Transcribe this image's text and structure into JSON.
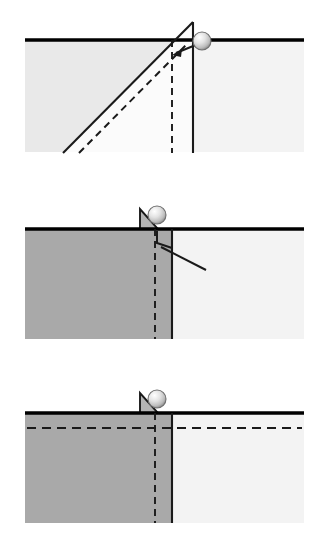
{
  "figure": {
    "type": "diagram",
    "background_color": "#ffffff",
    "width": 323,
    "height": 554,
    "panel_count": 3
  },
  "colors": {
    "stroke": "#1a1a1a",
    "surface_line": "#000000",
    "fill_light": "#e9e9e9",
    "fill_lighter": "#f3f3f3",
    "fill_dark": "#a9a9a9",
    "fill_medium": "#b4b4b4",
    "ball_light": "#f7f7f7",
    "ball_mid": "#cfcfcf",
    "ball_dark": "#8e8e8e",
    "background": "#ffffff"
  },
  "geometry": {
    "block_left": 25,
    "block_right": 304,
    "surface_thickness": 3.5,
    "panel_height": 185
  },
  "panels": [
    {
      "id": "panel-1",
      "label": "stage-1-initial-shear-ramp",
      "index": 1,
      "surface_y": 40,
      "block_bottom": 152,
      "elements": [
        {
          "name": "hanging-wall-left-block",
          "kind": "filled-region",
          "fill": "fill_light"
        },
        {
          "name": "footwall-right-block",
          "kind": "filled-region",
          "fill": "fill_lighter"
        },
        {
          "name": "ground-surface-line",
          "kind": "thick-horizontal-line",
          "y": 40,
          "x1": 25,
          "x2": 304
        },
        {
          "name": "fault-ramp-solid-line",
          "kind": "solid-slope",
          "x1": 63,
          "y1": 152,
          "x2": 193,
          "y2": 22
        },
        {
          "name": "fault-ramp-dashed-line",
          "kind": "dashed-slope",
          "x1": 78,
          "y1": 152,
          "x2": 185,
          "y2": 45
        },
        {
          "name": "vertical-solid-fault-line",
          "kind": "solid-vertical",
          "x": 193,
          "y1": 22,
          "y2": 152
        },
        {
          "name": "vertical-dashed-fault-line",
          "kind": "dashed-vertical",
          "x": 172,
          "y1": 40,
          "y2": 152
        },
        {
          "name": "displacement-arrow",
          "kind": "arrow",
          "from_x": 201,
          "from_y": 42,
          "to_x": 173,
          "to_y": 54
        },
        {
          "name": "marker-ball",
          "kind": "sphere",
          "cx": 202,
          "cy": 41,
          "r": 9
        }
      ]
    },
    {
      "id": "panel-2",
      "label": "stage-2-uplift-and-slip",
      "index": 2,
      "surface_y": 229,
      "block_bottom": 339,
      "elements": [
        {
          "name": "hanging-wall-left-block",
          "kind": "filled-region",
          "fill": "fill_dark"
        },
        {
          "name": "footwall-right-block",
          "kind": "filled-region",
          "fill": "fill_lighter"
        },
        {
          "name": "ground-surface-line",
          "kind": "thick-horizontal-line",
          "y": 229,
          "x1": 25,
          "x2": 304
        },
        {
          "name": "scarp-wedge-triangle",
          "kind": "filled-triangle",
          "fill": "fill_medium"
        },
        {
          "name": "vertical-solid-fault-line",
          "kind": "solid-vertical",
          "x": 172,
          "y1": 229,
          "y2": 339
        },
        {
          "name": "vertical-dashed-fault-line",
          "kind": "dashed-vertical",
          "x": 155,
          "y1": 229,
          "y2": 339
        },
        {
          "name": "offset-hook-line",
          "kind": "solid-polyline"
        },
        {
          "name": "slip-plane-line",
          "kind": "solid-slope",
          "x1": 160,
          "y1": 248,
          "x2": 205,
          "y2": 270
        },
        {
          "name": "marker-ball",
          "kind": "sphere",
          "cx": 157,
          "cy": 215,
          "r": 9
        }
      ]
    },
    {
      "id": "panel-3",
      "label": "stage-3-final-offset-with-datum",
      "index": 3,
      "surface_y": 413,
      "block_bottom": 523,
      "elements": [
        {
          "name": "hanging-wall-left-block",
          "kind": "filled-region",
          "fill": "fill_dark"
        },
        {
          "name": "footwall-right-block",
          "kind": "filled-region",
          "fill": "fill_lighter"
        },
        {
          "name": "ground-surface-line",
          "kind": "thick-horizontal-line",
          "y": 413,
          "x1": 25,
          "x2": 304
        },
        {
          "name": "scarp-wedge-triangle",
          "kind": "filled-triangle",
          "fill": "fill_medium"
        },
        {
          "name": "horizontal-dashed-marker-bed",
          "kind": "dashed-horizontal",
          "y": 428,
          "x1": 27,
          "x2": 302
        },
        {
          "name": "vertical-solid-fault-line",
          "kind": "solid-vertical",
          "x": 172,
          "y1": 413,
          "y2": 523
        },
        {
          "name": "vertical-dashed-fault-line",
          "kind": "dashed-vertical",
          "x": 155,
          "y1": 413,
          "y2": 523
        },
        {
          "name": "marker-ball",
          "kind": "sphere",
          "cx": 157,
          "cy": 399,
          "r": 9
        }
      ]
    }
  ]
}
